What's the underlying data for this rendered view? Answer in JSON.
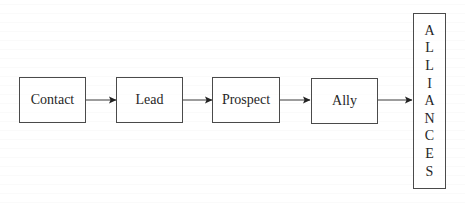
{
  "diagram": {
    "type": "flowchart",
    "direction": "left-to-right",
    "nodes": [
      {
        "id": "contact",
        "label": "Contact"
      },
      {
        "id": "lead",
        "label": "Lead"
      },
      {
        "id": "prospect",
        "label": "Prospect"
      },
      {
        "id": "ally",
        "label": "Ally"
      },
      {
        "id": "alliances",
        "label": "ALLIANCES",
        "letters": [
          "A",
          "L",
          "L",
          "I",
          "A",
          "N",
          "C",
          "E",
          "S"
        ],
        "orientation": "vertical"
      }
    ],
    "edges": [
      {
        "from": "contact",
        "to": "lead"
      },
      {
        "from": "lead",
        "to": "prospect"
      },
      {
        "from": "prospect",
        "to": "ally"
      },
      {
        "from": "ally",
        "to": "alliances"
      }
    ],
    "colors": {
      "stroke": "#4a4a4a",
      "text": "#262626",
      "background": "#ffffff"
    }
  }
}
